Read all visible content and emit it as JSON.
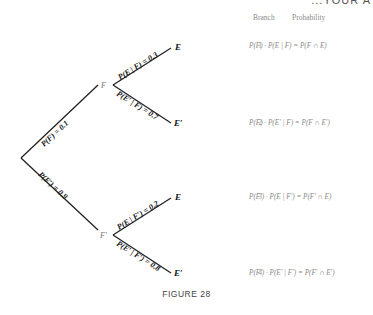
{
  "header": {
    "clipped_text": "...YOUR A"
  },
  "columns": {
    "branch": "Branch",
    "probability": "Probability"
  },
  "tree": {
    "root_edges": [
      {
        "label": "P(F) = 0.1",
        "to": "F"
      },
      {
        "label": "P(F′) = 0.9",
        "to": "F′"
      }
    ],
    "nodes": {
      "f": "F",
      "f_prime": "F′"
    },
    "leaf_edges": [
      {
        "label": "P(E | F) = 0.3",
        "leaf": "E"
      },
      {
        "label": "P(E′ | F) = 0.7",
        "leaf": "E′"
      },
      {
        "label": "P(E | F′) = 0.2",
        "leaf": "E"
      },
      {
        "label": "P(E′ | F′) = 0.8",
        "leaf": "E′"
      }
    ]
  },
  "branches": [
    {
      "number": "1",
      "probability": "P(F) · P(E | F) = P(F ∩ E)"
    },
    {
      "number": "2",
      "probability": "P(F) · P(E′ | F) = P(F ∩ E′)"
    },
    {
      "number": "3",
      "probability": "P(F′) · P(E | F′) = P(F′ ∩ E)"
    },
    {
      "number": "4",
      "probability": "P(F′) · P(E′ | F′) = P(F′ ∩ E′)"
    }
  ],
  "caption": "FIGURE 28"
}
